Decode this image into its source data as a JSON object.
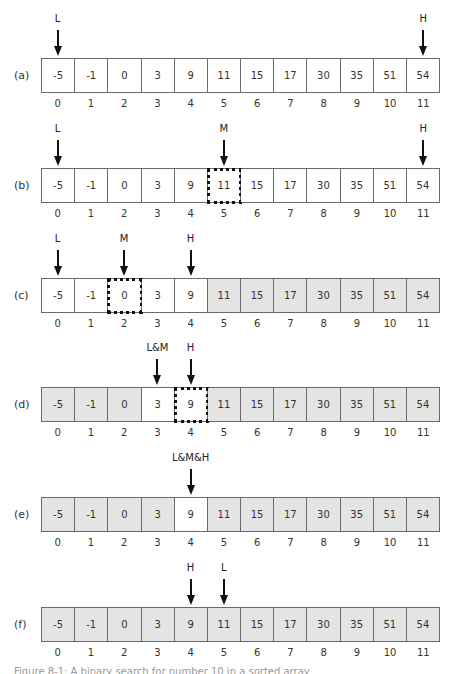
{
  "figure": {
    "values": [
      "-5",
      "-1",
      "0",
      "3",
      "9",
      "11",
      "15",
      "17",
      "30",
      "35",
      "51",
      "54"
    ],
    "indices": [
      "0",
      "1",
      "2",
      "3",
      "4",
      "5",
      "6",
      "7",
      "8",
      "9",
      "10",
      "11"
    ],
    "colors": {
      "shaded": "#e4e4e4",
      "unshaded": "#ffffff",
      "border": "#6a6a6a",
      "probe_border": "#111111"
    },
    "rows": [
      {
        "label": "(a)",
        "top": 58,
        "shaded": [],
        "probe": null,
        "pointers": [
          {
            "label": "L",
            "index": 0
          },
          {
            "label": "H",
            "index": 11
          }
        ]
      },
      {
        "label": "(b)",
        "top": 168,
        "shaded": [],
        "probe": 5,
        "pointers": [
          {
            "label": "L",
            "index": 0
          },
          {
            "label": "M",
            "index": 5
          },
          {
            "label": "H",
            "index": 11
          }
        ]
      },
      {
        "label": "(c)",
        "top": 278,
        "shaded": [
          5,
          6,
          7,
          8,
          9,
          10,
          11
        ],
        "probe": 2,
        "pointers": [
          {
            "label": "L",
            "index": 0
          },
          {
            "label": "M",
            "index": 2
          },
          {
            "label": "H",
            "index": 4
          }
        ]
      },
      {
        "label": "(d)",
        "top": 387,
        "shaded": [
          0,
          1,
          2,
          5,
          6,
          7,
          8,
          9,
          10,
          11
        ],
        "probe": 4,
        "pointers": [
          {
            "label": "L&M",
            "index": 3
          },
          {
            "label": "H",
            "index": 4
          }
        ]
      },
      {
        "label": "(e)",
        "top": 497,
        "shaded": [
          0,
          1,
          2,
          3,
          5,
          6,
          7,
          8,
          9,
          10,
          11
        ],
        "probe": null,
        "pointers": [
          {
            "label": "L&M&H",
            "index": 4
          }
        ]
      },
      {
        "label": "(f)",
        "top": 607,
        "shaded": [
          0,
          1,
          2,
          3,
          4,
          5,
          6,
          7,
          8,
          9,
          10,
          11
        ],
        "probe": null,
        "pointers": [
          {
            "label": "H",
            "index": 4
          },
          {
            "label": "L",
            "index": 5
          }
        ]
      }
    ],
    "caption": "Figure 8-1: A binary search for number 10 in a sorted array"
  }
}
